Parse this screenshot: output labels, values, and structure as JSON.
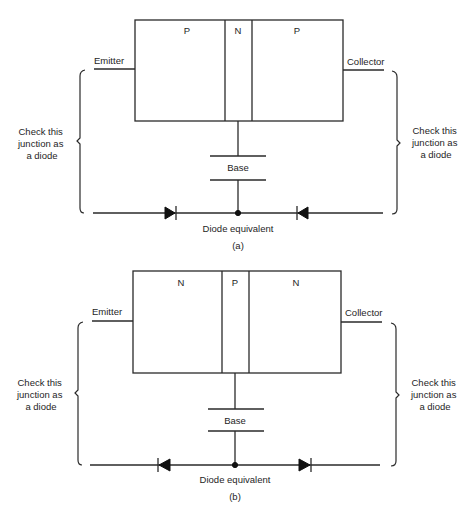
{
  "figure": {
    "diagrams": [
      {
        "id": "a",
        "caption": "(a)",
        "transistor_type": "PNP",
        "regions": [
          "P",
          "N",
          "P"
        ],
        "emitter_label": "Emitter",
        "collector_label": "Collector",
        "base_label": "Base",
        "left_annotation": [
          "Check this",
          "junction as",
          "a diode"
        ],
        "right_annotation": [
          "Check this",
          "junction as",
          "a diode"
        ],
        "equivalent_label": "Diode equivalent",
        "left_diode_direction": "right",
        "right_diode_direction": "left"
      },
      {
        "id": "b",
        "caption": "(b)",
        "transistor_type": "NPN",
        "regions": [
          "N",
          "P",
          "N"
        ],
        "emitter_label": "Emitter",
        "collector_label": "Collector",
        "base_label": "Base",
        "left_annotation": [
          "Check this",
          "junction as",
          "a diode"
        ],
        "right_annotation": [
          "Check this",
          "junction as",
          "a diode"
        ],
        "equivalent_label": "Diode equivalent",
        "left_diode_direction": "left",
        "right_diode_direction": "right"
      }
    ]
  }
}
